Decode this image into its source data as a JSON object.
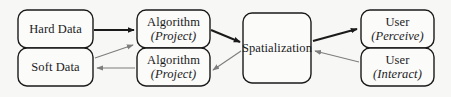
{
  "diagram": {
    "background_color": "#f7f7f5",
    "stroke_color_dark": "#1a1a1a",
    "stroke_color_light": "#7d7d7d",
    "text_color": "#1a1a1a",
    "nodes": [
      {
        "id": "hard-data",
        "label": "Hard Data",
        "sublabel": "",
        "x": 18,
        "y": 10,
        "w": 75,
        "h": 38,
        "r": 9
      },
      {
        "id": "soft-data",
        "label": "Soft Data",
        "sublabel": "",
        "x": 18,
        "y": 48,
        "w": 75,
        "h": 38,
        "r": 9
      },
      {
        "id": "algorithm-project-top",
        "label": "Algorithm",
        "sublabel": "(Project)",
        "x": 137,
        "y": 10,
        "w": 73,
        "h": 38,
        "r": 9
      },
      {
        "id": "algorithm-project-bottom",
        "label": "Algorithm",
        "sublabel": "(Project)",
        "x": 137,
        "y": 48,
        "w": 73,
        "h": 38,
        "r": 9
      },
      {
        "id": "spatialization",
        "label": "Spatialization",
        "sublabel": "",
        "x": 243,
        "y": 13,
        "w": 68,
        "h": 70,
        "r": 9
      },
      {
        "id": "user-perceive",
        "label": "User",
        "sublabel": "(Perceive)",
        "x": 361,
        "y": 10,
        "w": 73,
        "h": 38,
        "r": 9
      },
      {
        "id": "user-interact",
        "label": "User",
        "sublabel": "(Interact)",
        "x": 361,
        "y": 48,
        "w": 73,
        "h": 38,
        "r": 9
      }
    ],
    "edges": [
      {
        "id": "hard-data-to-algorithm",
        "from": "hard-data",
        "to": "algorithm-project-top",
        "weight": "thick",
        "color": "#1a1a1a"
      },
      {
        "id": "algorithm-to-spatialization",
        "from": "algorithm-project-top",
        "to": "spatialization",
        "weight": "thick",
        "color": "#1a1a1a"
      },
      {
        "id": "spatialization-to-user-perceive",
        "from": "spatialization",
        "to": "user-perceive",
        "weight": "thick",
        "color": "#1a1a1a"
      },
      {
        "id": "user-interact-to-spatialization",
        "from": "user-interact",
        "to": "spatialization",
        "weight": "thin",
        "color": "#7d7d7d"
      },
      {
        "id": "spatialization-to-algorithm-bottom",
        "from": "spatialization",
        "to": "algorithm-project-bottom",
        "weight": "thin",
        "color": "#7d7d7d"
      },
      {
        "id": "algorithm-bottom-to-soft-data",
        "from": "algorithm-project-bottom",
        "to": "soft-data",
        "weight": "thin",
        "color": "#7d7d7d"
      },
      {
        "id": "soft-data-to-algorithm-top",
        "from": "soft-data",
        "to": "algorithm-project-top",
        "weight": "thin",
        "color": "#7d7d7d"
      }
    ]
  }
}
